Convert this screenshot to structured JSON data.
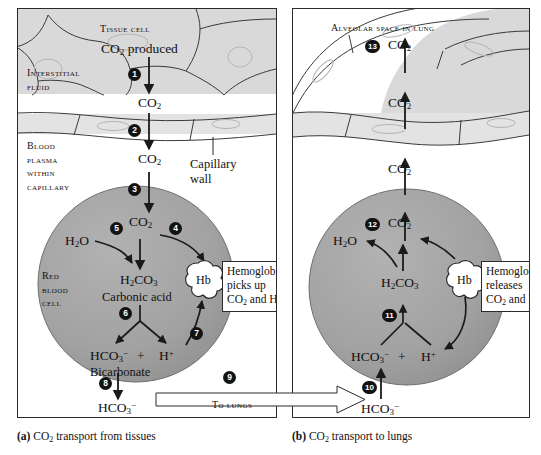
{
  "figure": {
    "colors": {
      "tissue_fill": "#d9d9d9",
      "wall_fill": "#e3e3e3",
      "rbc_fill": "#a3a3a3",
      "plasma_fill": "#ffffff",
      "line": "#2b2b2b",
      "step_bullet": "#121212",
      "step_text": "#ffffff"
    }
  },
  "panel_a": {
    "caption_label": "(a)",
    "caption_text": "CO₂ transport from tissues",
    "regions": {
      "tissue_cell": "Tissue cell",
      "interstitial_fluid": "Interstitial fluid",
      "blood_plasma": "Blood plasma within capillary",
      "red_blood_cell": "Red blood cell",
      "capillary_wall": "Capillary wall"
    },
    "molecules": {
      "co2_produced": "CO₂ produced",
      "co2_interstitial": "CO₂",
      "co2_plasma": "CO₂",
      "co2_rbc": "CO₂",
      "h2o": "H₂O",
      "h2co3": "H₂CO₃",
      "carbonic_acid": "Carbonic acid",
      "hco3_ion": "HCO₃⁻",
      "bicarbonate": "Bicarbonate",
      "h_ion": "H⁺",
      "plus": "+",
      "hco3_plasma": "HCO₃⁻",
      "hb": "Hb"
    },
    "callout": {
      "line1": "Hemoglobin",
      "line2": "picks up",
      "line3": "CO₂ and H⁺"
    },
    "steps": [
      "1",
      "2",
      "3",
      "4",
      "5",
      "6",
      "7",
      "8"
    ]
  },
  "panel_b": {
    "caption_label": "(b)",
    "caption_text": "CO₂ transport to lungs",
    "regions": {
      "alveolar_space": "Alveolar space in lung"
    },
    "molecules": {
      "co2_alveolar": "CO₂",
      "co2_wall": "CO₂",
      "co2_plasma": "CO₂",
      "co2_rbc": "CO₂",
      "h2o": "H₂O",
      "h2co3": "H₂CO₃",
      "hco3_ion": "HCO₃⁻",
      "h_ion": "H⁺",
      "plus": "+",
      "hco3_plasma": "HCO₃⁻",
      "hb": "Hb"
    },
    "callout": {
      "line1": "Hemoglobin",
      "line2": "releases",
      "line3": "CO₂ and H⁺"
    },
    "steps": [
      "10",
      "11",
      "12",
      "13"
    ]
  },
  "connector": {
    "step": "9",
    "label": "To lungs"
  }
}
